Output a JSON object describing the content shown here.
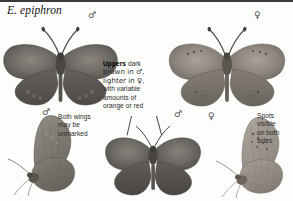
{
  "page": {
    "title": "E. epiphron",
    "background_color": "#fdfdfb",
    "rule_color": "#3a3a3c"
  },
  "symbols": {
    "male": "♂",
    "female": "♀"
  },
  "specimens": [
    {
      "name": "male-upperside",
      "sex": "♂",
      "view": "upperside",
      "color": "#6e6a66",
      "label_x": 90,
      "label_y": 12
    },
    {
      "name": "female-upperside",
      "sex": "♀",
      "view": "upperside",
      "color": "#8d8780",
      "label_x": 256,
      "label_y": 12
    },
    {
      "name": "male-underside-left",
      "sex": "♂",
      "view": "underside",
      "color": "#7d7872",
      "label_x": 44,
      "label_y": 108
    },
    {
      "name": "male-upperside-lower",
      "sex": "♂",
      "view": "upperside",
      "color": "#6b6763",
      "label_x": 176,
      "label_y": 110
    },
    {
      "name": "female-underside-right",
      "sex": "♀",
      "view": "underside",
      "color": "#9a948b",
      "label_x": 210,
      "label_y": 112
    }
  ],
  "captions": {
    "uppers": {
      "lead": "Uppers",
      "line1": " dark",
      "line2": "brown in ♂,",
      "line3": "lighter in ♀,",
      "line4": "with variable",
      "line5": "amounts of",
      "line6": "orange or red"
    },
    "unmarked": {
      "line1": "Both wings",
      "line2": "may be",
      "line3": "unmarked"
    },
    "spots": {
      "line1": "Spots",
      "line2": "visible",
      "line3": "on both",
      "line4": "sides"
    }
  }
}
